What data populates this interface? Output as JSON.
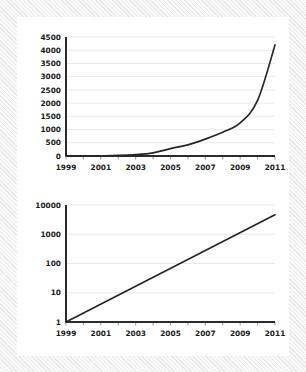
{
  "figure": {
    "background_color": "#f4f4f4",
    "panel_color": "#ffffff",
    "line_color": "#262626",
    "grid_color": "#e6e6e6",
    "axis_color": "#2b2b2b"
  },
  "chart_data": [
    {
      "type": "line",
      "title": "",
      "subtitle": "",
      "xlabel": "",
      "ylabel": "",
      "scale": "linear",
      "legend": "none",
      "grid": "horizontal",
      "xlim": [
        1999,
        2011
      ],
      "ylim": [
        0,
        4500
      ],
      "yticks": [
        0,
        500,
        1000,
        1500,
        2000,
        2500,
        3000,
        3500,
        4000,
        4500
      ],
      "ytick_labels": [
        "0",
        "500",
        "1000",
        "1500",
        "2000",
        "2500",
        "3000",
        "3500",
        "4000",
        "4500"
      ],
      "xticks": [
        1999,
        2000,
        2001,
        2002,
        2003,
        2004,
        2005,
        2006,
        2007,
        2008,
        2009,
        2010,
        2011
      ],
      "xtick_labels": [
        "1999",
        "",
        "2001",
        "",
        "2003",
        "",
        "2005",
        "",
        "2007",
        "",
        "2009",
        "",
        "2011"
      ],
      "xtick_labels_shown": [
        "1999",
        "2001",
        "2003",
        "2005",
        "2007",
        "2009",
        "2011"
      ],
      "x": [
        1999,
        2000,
        2001,
        2002,
        2003,
        2004,
        2005,
        2006,
        2007,
        2008,
        2009,
        2010,
        2011
      ],
      "values": [
        1,
        3,
        8,
        20,
        50,
        120,
        280,
        420,
        640,
        900,
        1250,
        2100,
        4200
      ]
    },
    {
      "type": "line",
      "title": "",
      "subtitle": "",
      "xlabel": "",
      "ylabel": "",
      "scale": "log",
      "legend": "none",
      "grid": "horizontal",
      "xlim": [
        1999,
        2011
      ],
      "ylim": [
        1,
        10000
      ],
      "yticks": [
        1,
        10,
        100,
        1000,
        10000
      ],
      "ytick_labels": [
        "1",
        "10",
        "100",
        "1000",
        "10000"
      ],
      "xticks": [
        1999,
        2000,
        2001,
        2002,
        2003,
        2004,
        2005,
        2006,
        2007,
        2008,
        2009,
        2010,
        2011
      ],
      "xtick_labels": [
        "1999",
        "",
        "2001",
        "",
        "2003",
        "",
        "2005",
        "",
        "2007",
        "",
        "2009",
        "",
        "2011"
      ],
      "xtick_labels_shown": [
        "1999",
        "2001",
        "2003",
        "2005",
        "2007",
        "2009",
        "2011"
      ],
      "x": [
        1999,
        2011
      ],
      "values": [
        1,
        4600
      ]
    }
  ]
}
